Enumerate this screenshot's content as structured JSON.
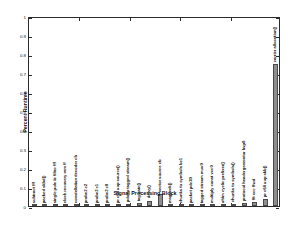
{
  "chart_data": {
    "type": "bar",
    "title": "",
    "xlabel": "Signal Processing Block",
    "ylabel": "Percent Runtime",
    "ylim": [
      0,
      1
    ],
    "yticks": [
      "0",
      "0.1",
      "0.2",
      "0.3",
      "0.4",
      "0.5",
      "0.6",
      "0.7",
      "0.8",
      "0.9",
      "1"
    ],
    "ytick_values": [
      0,
      0.1,
      0.2,
      0.3,
      0.4,
      0.5,
      0.6,
      0.7,
      0.8,
      0.9,
      1
    ],
    "grid": false,
    "legend": "none",
    "bar_color": "#8e8e8e",
    "bar_edge_color": "#4a4a4a",
    "categories": [
      "subtract fff",
      "packed skbd()",
      "single pole iir filter fff",
      "clock recovery mm ff",
      "constellation decoder cb",
      "probe2 c2",
      "probe2 c1",
      "probe2 c0",
      "pr c64 uop source()",
      "pdo to tagged stream()",
      "tag gate()",
      "delay()",
      "vector source cb",
      "magpeek()",
      "chunks to symbols bc1",
      "packet pdc30",
      "tagged stream mux0",
      "multiply const vcc0",
      "ofdm cyclic prefixer()",
      "chunks to symbols()",
      "protocol headergenerator bvp0",
      "fft vcc ffwd",
      "pr c64 uop skb()",
      "carrier allocation()"
    ],
    "values": [
      0.004,
      0.004,
      0.003,
      0.003,
      0.004,
      0.003,
      0.003,
      0.003,
      0.004,
      0.009,
      0.015,
      0.028,
      0.064,
      0.003,
      0.004,
      0.004,
      0.004,
      0.004,
      0.004,
      0.009,
      0.014,
      0.021,
      0.036,
      0.745
    ]
  }
}
